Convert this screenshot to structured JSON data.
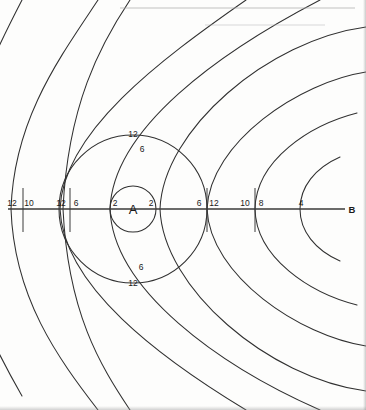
{
  "diagram": {
    "type": "hand-drawn-scan",
    "background_color": "#fdfdfc",
    "ink_color": "#303030",
    "sources": [
      {
        "id": "A",
        "label": "A",
        "cx": 133,
        "cy": 209,
        "inner_circle_r": 23
      },
      {
        "id": "B",
        "label": "B",
        "cx": 350,
        "cy": 209
      }
    ],
    "axis": {
      "y": 209,
      "x_start": 8,
      "x_end": 345
    },
    "axis_labels": [
      {
        "text": "12",
        "x": 12,
        "y": 206,
        "anchor": "middle"
      },
      {
        "text": "10",
        "x": 29,
        "y": 206,
        "anchor": "middle"
      },
      {
        "text": "12",
        "x": 61,
        "y": 206,
        "anchor": "middle"
      },
      {
        "text": "6",
        "x": 76,
        "y": 206,
        "anchor": "middle"
      },
      {
        "text": "2",
        "x": 115,
        "y": 206,
        "anchor": "middle"
      },
      {
        "text": "2",
        "x": 151,
        "y": 206,
        "anchor": "middle"
      },
      {
        "text": "6",
        "x": 199,
        "y": 206,
        "anchor": "middle"
      },
      {
        "text": "12",
        "x": 214,
        "y": 206,
        "anchor": "middle"
      },
      {
        "text": "10",
        "x": 245,
        "y": 206,
        "anchor": "middle"
      },
      {
        "text": "8",
        "x": 261,
        "y": 206,
        "anchor": "middle"
      },
      {
        "text": "4",
        "x": 301,
        "y": 206,
        "anchor": "middle"
      }
    ],
    "vertical_labels": [
      {
        "text": "12",
        "x": 133,
        "y": 137,
        "anchor": "middle",
        "position": "top-outer"
      },
      {
        "text": "6",
        "x": 142,
        "y": 152,
        "anchor": "middle",
        "position": "top-inner"
      },
      {
        "text": "6",
        "x": 141,
        "y": 270,
        "anchor": "middle",
        "position": "bottom-inner"
      },
      {
        "text": "12",
        "x": 133,
        "y": 286,
        "anchor": "middle",
        "position": "bottom-outer"
      }
    ],
    "source_label_A": {
      "text": "A",
      "x": 133,
      "y": 214
    },
    "source_label_B": {
      "text": "B",
      "x": 352,
      "y": 213
    },
    "tick_marks": [
      {
        "x": 23,
        "y1": 186,
        "y2": 236
      },
      {
        "x": 70,
        "y1": 186,
        "y2": 236
      },
      {
        "x": 207,
        "y1": 186,
        "y2": 236
      },
      {
        "x": 255,
        "y1": 186,
        "y2": 236
      }
    ],
    "a_wave_radii": [
      23,
      74,
      122,
      170,
      218
    ],
    "b_wave_radii": [
      50,
      95,
      143,
      190,
      240,
      290
    ]
  }
}
